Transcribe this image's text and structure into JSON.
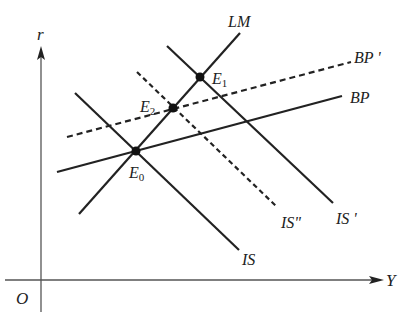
{
  "diagram": {
    "type": "IS-LM-BP model",
    "axes": {
      "y_label": "r",
      "x_label": "Y",
      "origin_label": "O"
    },
    "curves": [
      {
        "id": "LM",
        "label": "LM",
        "style": "solid"
      },
      {
        "id": "IS",
        "label": "IS",
        "style": "solid"
      },
      {
        "id": "IS_prime",
        "label": "IS '",
        "style": "solid"
      },
      {
        "id": "IS_double_prime",
        "label": "IS\"",
        "style": "dashed"
      },
      {
        "id": "BP",
        "label": "BP",
        "style": "solid"
      },
      {
        "id": "BP_prime",
        "label": "BP '",
        "style": "dashed"
      }
    ],
    "points": [
      {
        "id": "E0",
        "label": "E",
        "subscript": "0"
      },
      {
        "id": "E1",
        "label": "E",
        "subscript": "1"
      },
      {
        "id": "E2",
        "label": "E",
        "subscript": "2"
      }
    ],
    "colors": {
      "line": "#222222",
      "axis": "#555555",
      "background": "#ffffff"
    }
  }
}
